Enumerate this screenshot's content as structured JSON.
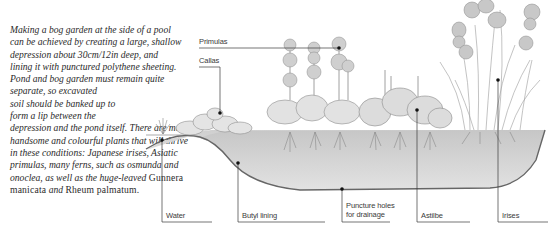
{
  "intro": {
    "p1": "Making a bog garden at the side of a pool can be achieved by creating a large, shallow depression about 30cm/12in deep, and lining it with punctured polythene sheeting. Pond and bog garden must remain quite separate, so excavated",
    "p2": "soil should be banked up to",
    "p3": "form a lip between the",
    "p4": "depression and the pond itself. There are many handsome and colourful plants that will thrive in these conditions: Japanese irises, Asiatic primulas, many ferns, such as osmunda and onoclea, as well as the huge-leaved",
    "latin1": "Gunnera manicata",
    "p5": "and",
    "latin2": "Rheum palmatum."
  },
  "labels": {
    "primulas": "Primulas",
    "callas": "Callas",
    "water": "Water",
    "butyl": "Butyl lining",
    "puncture_1": "Puncture holes",
    "puncture_2": "for drainage",
    "astilbe": "Astilbe",
    "irises": "Irises"
  },
  "colors": {
    "line": "#3a3a3a",
    "soil": "#d8d8d8",
    "foliage": "#9a9a9a"
  }
}
